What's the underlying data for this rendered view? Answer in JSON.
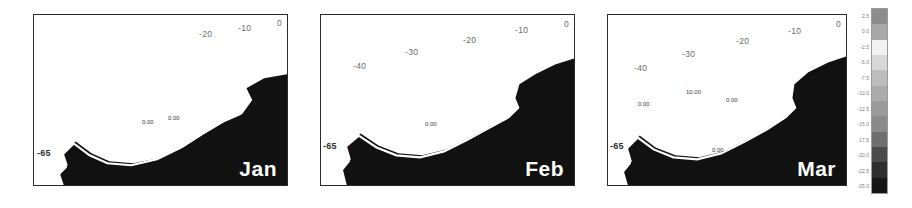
{
  "figure": {
    "background": "#ffffff",
    "panel_count": 3
  },
  "chart_data": {
    "type": "heatmap",
    "title": "",
    "subtitle": "",
    "xlabel": "",
    "ylabel": "",
    "grid": false,
    "legend_position": "right",
    "colorbar": {
      "orientation": "vertical",
      "ticks": [
        2.5,
        0.0,
        -2.5,
        -5.0,
        -7.5,
        -10.0,
        -12.5,
        -15.0,
        -17.5,
        -20.0,
        -22.5,
        -25.0
      ],
      "tick_labels": [
        "2.5",
        "0.0",
        "-2.5",
        "-5.0",
        "-7.5",
        "-10.0",
        "-12.5",
        "-15.0",
        "-17.5",
        "-20.0",
        "-22.5",
        "-25.0"
      ],
      "vmin": -25.0,
      "vmax": 2.5,
      "step": 2.5,
      "swatches": [
        "#8c8c8c",
        "#a8a8a8",
        "#f2f2f2",
        "#d8d8d8",
        "#bdbdbd",
        "#ababab",
        "#9a9a9a",
        "#8a8a8a",
        "#6e6e6e",
        "#4a4a4a",
        "#2e2e2e",
        "#161616"
      ]
    },
    "panels": [
      {
        "id": "panel-jan",
        "month_label": "Jan",
        "lon_ticks": [
          -20,
          -10,
          0
        ],
        "lon_tick_labels": [
          "-20",
          "-10",
          "0"
        ],
        "lat_ticks": [
          -65
        ],
        "lat_tick_labels": [
          "-65"
        ],
        "contour_labels": [
          "0.00",
          "0.00"
        ]
      },
      {
        "id": "panel-feb",
        "month_label": "Feb",
        "lon_ticks": [
          -40,
          -30,
          -20,
          -10,
          0
        ],
        "lon_tick_labels": [
          "-40",
          "-30",
          "-20",
          "-10",
          "0"
        ],
        "lat_ticks": [
          -65
        ],
        "lat_tick_labels": [
          "-65"
        ],
        "contour_labels": [
          "0.00"
        ]
      },
      {
        "id": "panel-mar",
        "month_label": "Mar",
        "lon_ticks": [
          -40,
          -30,
          -20,
          -10,
          0
        ],
        "lon_tick_labels": [
          "-40",
          "-30",
          "-20",
          "-10",
          "0"
        ],
        "lat_ticks": [
          -65
        ],
        "lat_tick_labels": [
          "-65"
        ],
        "contour_labels": [
          "10.00",
          "0.00",
          "0.00",
          "0.00"
        ]
      }
    ]
  }
}
